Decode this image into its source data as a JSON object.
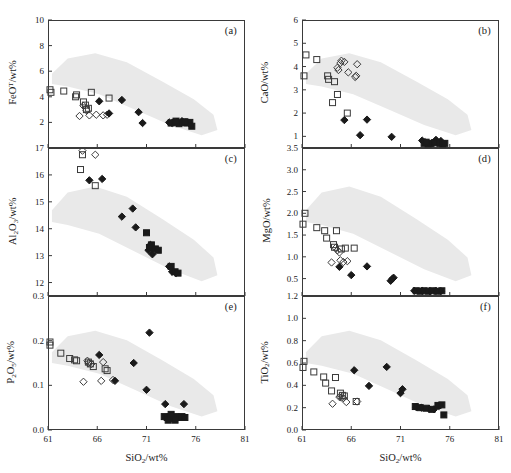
{
  "figure": {
    "xlabel": "SiO2/wt%",
    "xlabel_html": "SiO<sub>2</sub>/wt%",
    "xlim": [
      61,
      81
    ],
    "xticks": [
      61,
      66,
      71,
      76,
      81
    ],
    "background": "#ffffff",
    "field_color": "#e9e9e9",
    "axis_color": "#3a3a3a"
  },
  "legend_markers": [
    {
      "key": "open-square",
      "shape": "square",
      "fill": "none",
      "stroke": "#3a3a3a"
    },
    {
      "key": "open-diamond",
      "shape": "diamond",
      "fill": "none",
      "stroke": "#3a3a3a"
    },
    {
      "key": "filled-diamond",
      "shape": "diamond",
      "fill": "#1a1a1a",
      "stroke": "#1a1a1a"
    },
    {
      "key": "filled-square",
      "shape": "square",
      "fill": "#1a1a1a",
      "stroke": "#1a1a1a"
    }
  ],
  "chart_data": [
    {
      "panel": "a",
      "type": "scatter",
      "title": "(a)",
      "xlabel": "SiO2/wt%",
      "ylabel": "FeO^T/wt%",
      "ylabel_html": "FeO<sup>T</sup>/wt%",
      "xlim": [
        61,
        81
      ],
      "ylim": [
        0,
        10
      ],
      "yticks": [
        2,
        4,
        6,
        8,
        10
      ],
      "grid": false,
      "series": [
        {
          "name": "open-square",
          "points": [
            [
              61.2,
              4.55
            ],
            [
              61.3,
              4.35
            ],
            [
              62.6,
              4.45
            ],
            [
              63.9,
              4.15
            ],
            [
              63.8,
              4.0
            ],
            [
              65.4,
              4.35
            ],
            [
              64.6,
              3.6
            ],
            [
              64.8,
              3.35
            ],
            [
              64.9,
              3.0
            ],
            [
              65.1,
              3.1
            ],
            [
              67.2,
              3.9
            ]
          ]
        },
        {
          "name": "open-diamond",
          "points": [
            [
              64.6,
              3.3
            ],
            [
              64.9,
              2.95
            ],
            [
              64.2,
              2.5
            ],
            [
              65.2,
              2.55
            ],
            [
              65.9,
              2.6
            ],
            [
              66.6,
              2.55
            ],
            [
              67.0,
              2.6
            ]
          ]
        },
        {
          "name": "filled-diamond",
          "points": [
            [
              66.2,
              3.65
            ],
            [
              68.5,
              3.75
            ],
            [
              70.2,
              2.8
            ],
            [
              70.6,
              1.95
            ],
            [
              67.2,
              2.7
            ],
            [
              73.3,
              2.0
            ],
            [
              73.6,
              1.95
            ],
            [
              74.1,
              2.05
            ],
            [
              74.6,
              2.1
            ],
            [
              75.0,
              2.0
            ],
            [
              75.3,
              1.95
            ]
          ]
        },
        {
          "name": "filled-square",
          "points": [
            [
              73.5,
              1.95
            ],
            [
              73.9,
              2.0
            ],
            [
              74.3,
              1.9
            ],
            [
              74.7,
              2.0
            ],
            [
              75.1,
              1.95
            ],
            [
              75.4,
              2.0
            ],
            [
              75.6,
              1.7
            ],
            [
              74.0,
              2.1
            ],
            [
              74.9,
              2.05
            ]
          ]
        }
      ]
    },
    {
      "panel": "b",
      "type": "scatter",
      "title": "(b)",
      "xlabel": "SiO2/wt%",
      "ylabel": "CaO/wt%",
      "ylabel_html": "CaO/wt%",
      "xlim": [
        61,
        81
      ],
      "ylim": [
        0.5,
        6
      ],
      "yticks": [
        1,
        2,
        3,
        4,
        5,
        6
      ],
      "grid": false,
      "series": [
        {
          "name": "open-square",
          "points": [
            [
              61.4,
              4.5
            ],
            [
              61.2,
              3.6
            ],
            [
              62.5,
              4.3
            ],
            [
              63.6,
              3.6
            ],
            [
              63.7,
              3.45
            ],
            [
              64.3,
              3.35
            ],
            [
              64.6,
              2.8
            ],
            [
              64.1,
              2.45
            ],
            [
              65.6,
              2.0
            ]
          ]
        },
        {
          "name": "open-diamond",
          "points": [
            [
              65.0,
              4.25
            ],
            [
              64.9,
              4.15
            ],
            [
              64.6,
              3.95
            ],
            [
              64.7,
              3.85
            ],
            [
              65.3,
              4.2
            ],
            [
              65.7,
              3.75
            ],
            [
              66.6,
              4.1
            ],
            [
              66.4,
              3.55
            ],
            [
              66.5,
              3.6
            ]
          ]
        },
        {
          "name": "filled-diamond",
          "points": [
            [
              65.3,
              1.7
            ],
            [
              66.9,
              1.05
            ],
            [
              67.6,
              1.72
            ],
            [
              70.1,
              0.98
            ],
            [
              73.2,
              0.82
            ],
            [
              73.5,
              0.75
            ],
            [
              74.6,
              0.85
            ],
            [
              75.1,
              0.8
            ],
            [
              74.2,
              0.72
            ]
          ]
        },
        {
          "name": "filled-square",
          "points": [
            [
              73.4,
              0.7
            ],
            [
              73.8,
              0.68
            ],
            [
              74.1,
              0.7
            ],
            [
              74.5,
              0.72
            ],
            [
              75.0,
              0.7
            ],
            [
              75.3,
              0.68
            ],
            [
              75.5,
              0.7
            ],
            [
              73.6,
              0.75
            ]
          ]
        }
      ]
    },
    {
      "panel": "c",
      "type": "scatter",
      "title": "(c)",
      "xlabel": "SiO2/wt%",
      "ylabel": "Al2O3/wt%",
      "ylabel_html": "Al<sub>2</sub>O<sub>3</sub>/wt%",
      "xlim": [
        61,
        81
      ],
      "ylim": [
        11.5,
        17
      ],
      "yticks": [
        12,
        13,
        14,
        15,
        16,
        17
      ],
      "grid": false,
      "series": [
        {
          "name": "open-square",
          "points": [
            [
              64.5,
              16.75
            ],
            [
              64.3,
              16.2
            ],
            [
              65.8,
              15.6
            ]
          ]
        },
        {
          "name": "open-diamond",
          "points": [
            [
              64.5,
              16.9
            ],
            [
              65.8,
              16.75
            ]
          ]
        },
        {
          "name": "filled-diamond",
          "points": [
            [
              65.2,
              15.8
            ],
            [
              66.5,
              15.85
            ],
            [
              68.5,
              14.45
            ],
            [
              69.6,
              14.75
            ],
            [
              69.9,
              14.05
            ],
            [
              71.4,
              13.4
            ],
            [
              71.2,
              13.2
            ],
            [
              71.6,
              13.05
            ],
            [
              73.3,
              12.6
            ],
            [
              73.6,
              12.4
            ],
            [
              74.0,
              12.35
            ]
          ]
        },
        {
          "name": "filled-square",
          "points": [
            [
              71.0,
              13.85
            ],
            [
              71.5,
              13.4
            ],
            [
              71.9,
              13.25
            ],
            [
              72.2,
              13.2
            ],
            [
              73.5,
              12.6
            ],
            [
              73.9,
              12.4
            ],
            [
              74.2,
              12.35
            ],
            [
              71.3,
              13.3
            ]
          ]
        }
      ]
    },
    {
      "panel": "d",
      "type": "scatter",
      "title": "(d)",
      "xlabel": "SiO2/wt%",
      "ylabel": "MgO/wt%",
      "ylabel_html": "MgO/wt%",
      "xlim": [
        61,
        81
      ],
      "ylim": [
        0.1,
        3.5
      ],
      "yticks": [
        0.5,
        1.0,
        1.5,
        2.0,
        2.5,
        3.0,
        3.5
      ],
      "grid": false,
      "series": [
        {
          "name": "open-square",
          "points": [
            [
              61.3,
              2.0
            ],
            [
              61.1,
              1.75
            ],
            [
              62.5,
              1.67
            ],
            [
              63.3,
              1.6
            ],
            [
              63.5,
              1.43
            ],
            [
              64.5,
              1.6
            ],
            [
              64.2,
              1.28
            ],
            [
              64.3,
              1.22
            ],
            [
              65.4,
              1.2
            ],
            [
              66.3,
              1.2
            ],
            [
              65.0,
              1.18
            ]
          ]
        },
        {
          "name": "open-diamond",
          "points": [
            [
              64.0,
              0.87
            ],
            [
              64.9,
              0.92
            ],
            [
              65.2,
              0.88
            ],
            [
              65.6,
              0.9
            ],
            [
              64.4,
              1.2
            ],
            [
              64.6,
              1.15
            ],
            [
              64.8,
              1.1
            ]
          ]
        },
        {
          "name": "filled-diamond",
          "points": [
            [
              64.8,
              0.77
            ],
            [
              66.0,
              0.58
            ],
            [
              67.6,
              0.78
            ],
            [
              70.0,
              0.45
            ],
            [
              70.3,
              0.52
            ],
            [
              70.2,
              0.5
            ],
            [
              72.4,
              0.22
            ],
            [
              73.2,
              0.22
            ],
            [
              74.0,
              0.21
            ],
            [
              74.6,
              0.22
            ],
            [
              75.1,
              0.21
            ]
          ]
        },
        {
          "name": "filled-square",
          "points": [
            [
              72.6,
              0.22
            ],
            [
              73.0,
              0.21
            ],
            [
              73.4,
              0.22
            ],
            [
              73.8,
              0.21
            ],
            [
              74.2,
              0.22
            ],
            [
              74.7,
              0.21
            ],
            [
              75.2,
              0.22
            ]
          ]
        }
      ]
    },
    {
      "panel": "e",
      "type": "scatter",
      "title": "(e)",
      "xlabel": "SiO2/wt%",
      "ylabel": "P2O5/wt%",
      "ylabel_html": "P<sub>2</sub>O<sub>5</sub>/wt%",
      "xlim": [
        61,
        81
      ],
      "ylim": [
        0.0,
        0.3
      ],
      "yticks": [
        0.0,
        0.1,
        0.2,
        0.3
      ],
      "grid": false,
      "series": [
        {
          "name": "open-square",
          "points": [
            [
              61.2,
              0.197
            ],
            [
              61.2,
              0.19
            ],
            [
              62.3,
              0.172
            ],
            [
              63.2,
              0.16
            ],
            [
              63.7,
              0.157
            ],
            [
              63.9,
              0.155
            ],
            [
              65.1,
              0.152
            ],
            [
              65.3,
              0.148
            ],
            [
              65.6,
              0.142
            ],
            [
              67.0,
              0.133
            ],
            [
              66.8,
              0.137
            ]
          ]
        },
        {
          "name": "open-diamond",
          "points": [
            [
              65.0,
              0.155
            ],
            [
              65.1,
              0.15
            ],
            [
              65.4,
              0.148
            ],
            [
              64.6,
              0.108
            ],
            [
              66.6,
              0.152
            ],
            [
              66.4,
              0.11
            ],
            [
              67.6,
              0.112
            ]
          ]
        },
        {
          "name": "filled-diamond",
          "points": [
            [
              66.2,
              0.168
            ],
            [
              67.8,
              0.11
            ],
            [
              69.7,
              0.15
            ],
            [
              71.3,
              0.218
            ],
            [
              71.0,
              0.09
            ],
            [
              72.9,
              0.058
            ],
            [
              74.8,
              0.058
            ]
          ]
        },
        {
          "name": "filled-square",
          "points": [
            [
              72.8,
              0.03
            ],
            [
              73.1,
              0.028
            ],
            [
              73.4,
              0.03
            ],
            [
              73.7,
              0.026
            ],
            [
              74.0,
              0.03
            ],
            [
              74.3,
              0.028
            ],
            [
              74.6,
              0.03
            ],
            [
              73.2,
              0.022
            ],
            [
              73.9,
              0.022
            ],
            [
              74.9,
              0.028
            ],
            [
              73.5,
              0.035
            ]
          ]
        }
      ]
    },
    {
      "panel": "f",
      "type": "scatter",
      "title": "(f)",
      "xlabel": "SiO2/wt%",
      "ylabel": "TiO2/wt%",
      "ylabel_html": "TiO<sub>2</sub>/wt%",
      "xlim": [
        61,
        81
      ],
      "ylim": [
        0.0,
        1.2
      ],
      "yticks": [
        0.0,
        0.2,
        0.4,
        0.6,
        0.8,
        1.0,
        1.2
      ],
      "grid": false,
      "series": [
        {
          "name": "open-square",
          "points": [
            [
              61.2,
              0.615
            ],
            [
              61.1,
              0.56
            ],
            [
              62.2,
              0.52
            ],
            [
              63.2,
              0.475
            ],
            [
              63.4,
              0.42
            ],
            [
              64.4,
              0.47
            ],
            [
              64.0,
              0.35
            ],
            [
              64.9,
              0.33
            ],
            [
              65.1,
              0.31
            ],
            [
              65.3,
              0.305
            ],
            [
              66.5,
              0.255
            ]
          ]
        },
        {
          "name": "open-diamond",
          "points": [
            [
              64.1,
              0.235
            ],
            [
              64.8,
              0.295
            ],
            [
              65.0,
              0.29
            ],
            [
              65.2,
              0.285
            ],
            [
              65.5,
              0.25
            ],
            [
              66.6,
              0.255
            ]
          ]
        },
        {
          "name": "filled-diamond",
          "points": [
            [
              66.3,
              0.535
            ],
            [
              67.8,
              0.395
            ],
            [
              69.6,
              0.565
            ],
            [
              71.0,
              0.33
            ],
            [
              71.2,
              0.365
            ],
            [
              72.6,
              0.205
            ],
            [
              73.1,
              0.2
            ],
            [
              73.9,
              0.19
            ],
            [
              74.4,
              0.185
            ],
            [
              74.9,
              0.215
            ]
          ]
        },
        {
          "name": "filled-square",
          "points": [
            [
              72.5,
              0.21
            ],
            [
              73.0,
              0.2
            ],
            [
              73.6,
              0.195
            ],
            [
              74.2,
              0.185
            ],
            [
              74.8,
              0.22
            ],
            [
              75.2,
              0.225
            ],
            [
              75.4,
              0.135
            ]
          ]
        }
      ]
    }
  ]
}
